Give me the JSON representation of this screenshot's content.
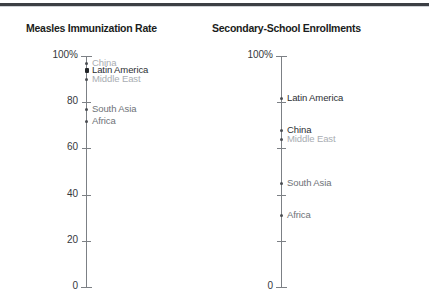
{
  "page": {
    "clipped_headline": "",
    "background_color": "#ffffff",
    "rule_color": "#3c3f44"
  },
  "chart_data": [
    {
      "type": "scatter",
      "title": "Measles Immunization Rate",
      "xlabel": "",
      "ylabel": "",
      "ylim": [
        0,
        100
      ],
      "grid": false,
      "legend_position": "inline-labels",
      "axis_tick_labels": [
        "100%",
        "80",
        "60",
        "40",
        "20",
        "0"
      ],
      "axis_tick_values": [
        100,
        80,
        60,
        40,
        20,
        0
      ],
      "categories": [
        "China",
        "Latin America",
        "Middle East",
        "South Asia",
        "Africa"
      ],
      "values": [
        97,
        94,
        90,
        77,
        72
      ],
      "point_styles": [
        "light",
        "dark",
        "light",
        "mid",
        "mid"
      ],
      "marker_styles": [
        "dot",
        "strong",
        "dot",
        "dot",
        "dot"
      ]
    },
    {
      "type": "scatter",
      "title": "Secondary-School Enrollments",
      "xlabel": "",
      "ylabel": "",
      "ylim": [
        0,
        100
      ],
      "grid": false,
      "legend_position": "inline-labels",
      "axis_tick_labels": [
        "100%",
        "",
        "",
        "",
        "",
        "0"
      ],
      "axis_tick_values": [
        100,
        80,
        60,
        40,
        20,
        0
      ],
      "categories": [
        "Latin America",
        "China",
        "Middle East",
        "South Asia",
        "Africa"
      ],
      "values": [
        82,
        68,
        64,
        45,
        31
      ],
      "point_styles": [
        "dark",
        "dark",
        "light",
        "mid",
        "mid"
      ],
      "marker_styles": [
        "dot",
        "dot",
        "dot",
        "dot",
        "dot"
      ]
    }
  ],
  "left_chart": {
    "title": "Measles Immunization Rate",
    "ticks": [
      {
        "label": "100%",
        "value": 100
      },
      {
        "label": "80",
        "value": 80
      },
      {
        "label": "60",
        "value": 60
      },
      {
        "label": "40",
        "value": 40
      },
      {
        "label": "20",
        "value": 20
      },
      {
        "label": "0",
        "value": 0
      }
    ],
    "points": [
      {
        "label": "China",
        "value": 97
      },
      {
        "label": "Latin America",
        "value": 94
      },
      {
        "label": "Middle East",
        "value": 90
      },
      {
        "label": "South Asia",
        "value": 77
      },
      {
        "label": "Africa",
        "value": 72
      }
    ]
  },
  "right_chart": {
    "title": "Secondary-School Enrollments",
    "ticks": [
      {
        "label": "100%",
        "value": 100
      },
      {
        "label": "",
        "value": 80
      },
      {
        "label": "",
        "value": 60
      },
      {
        "label": "",
        "value": 40
      },
      {
        "label": "",
        "value": 20
      },
      {
        "label": "0",
        "value": 0
      }
    ],
    "points": [
      {
        "label": "Latin America",
        "value": 82
      },
      {
        "label": "China",
        "value": 68
      },
      {
        "label": "Middle East",
        "value": 64
      },
      {
        "label": "South Asia",
        "value": 45
      },
      {
        "label": "Africa",
        "value": 31
      }
    ]
  }
}
